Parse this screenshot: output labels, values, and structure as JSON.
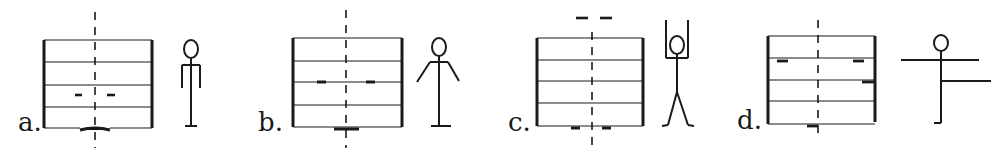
{
  "diagram": {
    "ink_color": "#1a1a1a",
    "background": "#ffffff",
    "panels": [
      {
        "id": "a",
        "label": "a.",
        "label_pos": [
          18,
          128
        ],
        "box": {
          "left": 44,
          "right": 152,
          "top": 40,
          "bottom": 128,
          "lines": [
            62,
            85,
            107
          ],
          "bottom_gap": [
            80,
            110
          ]
        },
        "center_x": 95,
        "dashline": {
          "y1": 12,
          "y2": 148
        },
        "marks": [
          {
            "x1": 75,
            "x2": 82,
            "y": 95
          },
          {
            "x1": 107,
            "x2": 115,
            "y": 95
          },
          {
            "x1": 80,
            "x2": 110,
            "y": 130,
            "thick": 3
          }
        ],
        "figure": {
          "pose": "arms-down",
          "x": 190
        }
      },
      {
        "id": "b",
        "label": "b.",
        "label_pos": [
          258,
          128
        ],
        "box": {
          "left": 292,
          "right": 402,
          "top": 38,
          "bottom": 127,
          "lines": [
            61,
            82,
            105
          ]
        },
        "center_x": 346,
        "dashline": {
          "y1": 10,
          "y2": 148
        },
        "marks": [
          {
            "x1": 317,
            "x2": 326,
            "y": 82
          },
          {
            "x1": 366,
            "x2": 375,
            "y": 82
          },
          {
            "x1": 334,
            "x2": 359,
            "y": 129,
            "thick": 3
          }
        ],
        "figure": {
          "pose": "arms-diagonal",
          "x": 440
        }
      },
      {
        "id": "c",
        "label": "c.",
        "label_pos": [
          508,
          128
        ],
        "box": {
          "left": 537,
          "right": 643,
          "top": 38,
          "bottom": 126,
          "lines": [
            60,
            81,
            103
          ]
        },
        "center_x": 592,
        "dashline": {
          "y1": 32,
          "y2": 148
        },
        "marks": [
          {
            "x1": 576,
            "x2": 588,
            "y": 18
          },
          {
            "x1": 600,
            "x2": 612,
            "y": 18
          },
          {
            "x1": 571,
            "x2": 580,
            "y": 128
          },
          {
            "x1": 602,
            "x2": 611,
            "y": 128
          }
        ],
        "figure": {
          "pose": "arms-up-legs-apart",
          "x": 678
        }
      },
      {
        "id": "d",
        "label": "d.",
        "label_pos": [
          737,
          126
        ],
        "box": {
          "left": 768,
          "right": 875,
          "top": 36,
          "bottom": 124,
          "lines": [
            58,
            80,
            101
          ]
        },
        "center_x": 818,
        "dashline": {
          "y1": 20,
          "y2": 135
        },
        "marks": [
          {
            "x1": 777,
            "x2": 788,
            "y": 61
          },
          {
            "x1": 853,
            "x2": 864,
            "y": 61
          },
          {
            "x1": 862,
            "x2": 874,
            "y": 81
          },
          {
            "x1": 807,
            "x2": 818,
            "y": 126
          }
        ],
        "figure": {
          "pose": "t-balance",
          "x": 940
        }
      }
    ]
  }
}
